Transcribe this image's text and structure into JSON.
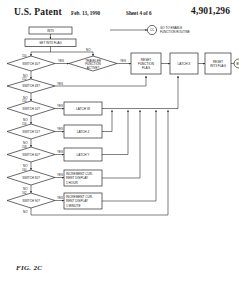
{
  "header": {
    "office": "U.S. Patent",
    "date": "Feb. 13, 1990",
    "sheet": "Sheet 4 of 6",
    "patent_number": "4,901,296"
  },
  "figure": {
    "label": "FIG. 2C"
  },
  "flowchart": {
    "entry_boxes": [
      {
        "id": "int3",
        "label": "INT3"
      },
      {
        "id": "set_int3_flag",
        "label": "SET INT3 FLAG"
      }
    ],
    "top_connector": {
      "circle_label": "CC",
      "note_line1": "GO TO ENABLE",
      "note_line2": "FUNCTION ROUTINE"
    },
    "exit_connector": {
      "circle_label": "BB"
    },
    "decisions": [
      {
        "id": "d1",
        "label": "SWITCH 40?",
        "ref": "150",
        "yes": "YES",
        "no": "NO"
      },
      {
        "id": "d2",
        "label": "SWITCH 48?",
        "ref": "152",
        "yes": "YES",
        "no": "NO"
      },
      {
        "id": "d3",
        "label": "SWITCH 50?",
        "ref": "154",
        "yes": "YES",
        "no": "NO"
      },
      {
        "id": "d4",
        "label": "SWITCH 55?",
        "ref": "156",
        "yes": "YES",
        "no": "NO"
      },
      {
        "id": "d5",
        "label": "SWITCH 60?",
        "ref": "158",
        "yes": "YES",
        "no": "NO"
      },
      {
        "id": "d6",
        "label": "SWITCH 80?",
        "ref": "160",
        "yes": "YES",
        "no": "NO"
      },
      {
        "id": "d7",
        "label": "SWITCH 90?",
        "ref": "162",
        "yes": "YES",
        "no": "NO"
      }
    ],
    "traveler_decision": {
      "id": "traveler",
      "line1": "TRAVELER",
      "line2": "FUNCTION",
      "line3": "ACTIVE?",
      "yes": "YES",
      "no": "NO"
    },
    "process_boxes": [
      {
        "id": "reset_function_flag",
        "line1": "RESET",
        "line2": "FUNCTION",
        "line3": "FLAG"
      },
      {
        "id": "latch_x",
        "line1": "LATCH X",
        "line2": "",
        "line3": ""
      },
      {
        "id": "reset_int3_flag",
        "line1": "RESET",
        "line2": "INT3 FLAG",
        "line3": ""
      },
      {
        "id": "latch_w",
        "line1": "LATCH W",
        "line2": "",
        "line3": ""
      },
      {
        "id": "latch_z",
        "line1": "LATCH Z",
        "line2": "",
        "line3": ""
      },
      {
        "id": "latch_y",
        "line1": "LATCH Y",
        "line2": "",
        "line3": ""
      },
      {
        "id": "increment_hour",
        "line1": "INCREMENT CUR-",
        "line2": "RENT DISPLAY",
        "line3": "1 HOUR"
      },
      {
        "id": "increment_minute",
        "line1": "INCREMENT CUR-",
        "line2": "RENT DISPLAY",
        "line3": "1 MINUTE"
      }
    ]
  },
  "colors": {
    "ink": "#1a1a1a",
    "stroke": "#2a2a2a",
    "paper": "#ffffff"
  }
}
